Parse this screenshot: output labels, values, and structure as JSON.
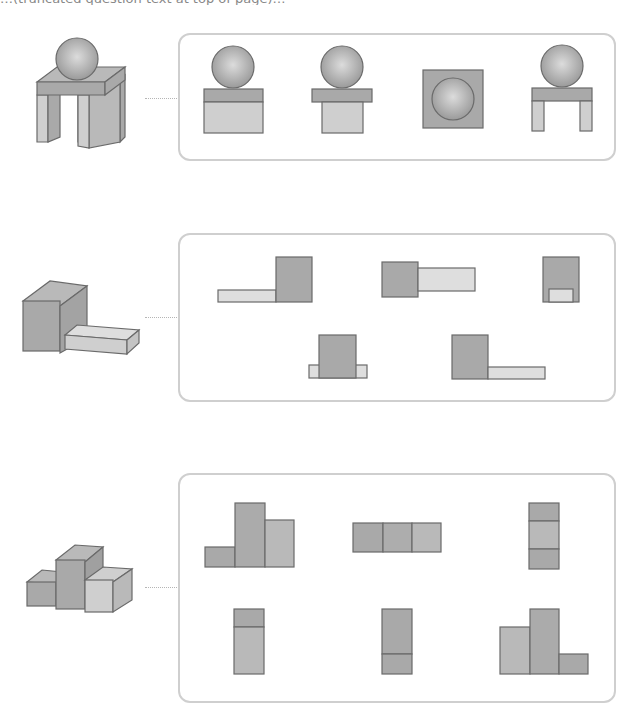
{
  "instruction": {
    "text": "…(truncated question text at top of page)…",
    "truncated": true
  },
  "colors": {
    "box_border": "#cfcfcf",
    "connector": "#b5b5b5",
    "face_dark": "#a9a9a9",
    "face_mid": "#b9b9b9",
    "face_light": "#cfcfcf",
    "face_extra_light": "#dedede",
    "outline": "#6a6a6a"
  },
  "problems": [
    {
      "id": 1,
      "solid": "sphere-on-table (sphere resting on a slab with two legs)",
      "candidate_views": [
        "sphere above slab on solid block",
        "sphere above wide slab on narrower block",
        "circle inside square (top view)",
        "sphere above slab with two legs"
      ]
    },
    {
      "id": 2,
      "solid": "tall cuboid with a low flat slab attached to its right",
      "candidate_views": [
        "long thin slab left of tall square",
        "square with long slab to its right (mid-height)",
        "square with small light square at bottom center",
        "tall block with small slab tabs on both sides",
        "tall block with long slab at bottom right"
      ]
    },
    {
      "id": 3,
      "solid": "stepped stack of three columns (short, tall, medium)",
      "candidate_views": [
        "short, tall, medium columns (front)",
        "three squares in a row (top)",
        "three stacked squares (side)",
        "column: short top cell + tall light cell",
        "column: tall dark cell + short bottom cell",
        "medium, tall, short columns (back)"
      ]
    }
  ]
}
